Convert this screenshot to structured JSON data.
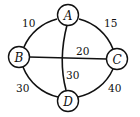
{
  "diagram": {
    "type": "weighted-graph",
    "nodes": [
      {
        "id": "A",
        "label": "A"
      },
      {
        "id": "B",
        "label": "B"
      },
      {
        "id": "C",
        "label": "C"
      },
      {
        "id": "D",
        "label": "D"
      }
    ],
    "edges": [
      {
        "from": "A",
        "to": "B",
        "weight": "10"
      },
      {
        "from": "A",
        "to": "C",
        "weight": "15"
      },
      {
        "from": "B",
        "to": "C",
        "weight": "20"
      },
      {
        "from": "A",
        "to": "D",
        "weight": "30"
      },
      {
        "from": "B",
        "to": "D",
        "weight": "30"
      },
      {
        "from": "C",
        "to": "D",
        "weight": "40"
      }
    ]
  }
}
